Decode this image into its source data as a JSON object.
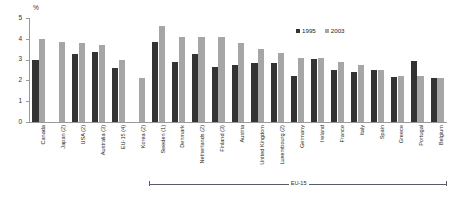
{
  "chart_data": {
    "type": "bar",
    "title": "",
    "subtitle": "",
    "xlabel": "",
    "ylabel": "%",
    "ylim": [
      0,
      5
    ],
    "yticks": [
      "0",
      "1",
      "2",
      "3",
      "4",
      "5"
    ],
    "grid": false,
    "legend_position": "top-right",
    "categories": [
      "Canada",
      "Japan (2)",
      "USA (2)",
      "Australia (3)",
      "EU-15 (4)",
      "Korea (2)",
      "Sweden (1)",
      "Denmark",
      "Netherlands (2)",
      "Finland (3)",
      "Austria",
      "United Kingdom",
      "Luxembourg (2)",
      "Germany",
      "Ireland",
      "France",
      "Italy",
      "Spain",
      "Greece",
      "Portugal",
      "Belgium"
    ],
    "series": [
      {
        "name": "1995",
        "color": "#333333",
        "values": [
          3.0,
          null,
          3.25,
          3.35,
          2.6,
          null,
          3.85,
          2.9,
          3.25,
          2.65,
          2.75,
          2.85,
          2.85,
          2.2,
          3.05,
          2.5,
          2.4,
          2.5,
          2.15,
          2.95,
          2.1
        ]
      },
      {
        "name": "2003",
        "color": "#a6a6a6",
        "values": [
          4.0,
          3.85,
          3.8,
          3.7,
          3.0,
          2.1,
          4.6,
          4.1,
          4.1,
          4.1,
          3.8,
          3.5,
          3.3,
          3.1,
          3.1,
          2.9,
          2.75,
          2.5,
          2.2,
          2.2,
          2.1
        ]
      }
    ],
    "annotations": [
      {
        "name": "eu15-bracket",
        "label": "EU-15",
        "from_category": "Sweden (1)",
        "to_category": "Belgium"
      }
    ]
  },
  "legend": {
    "items": [
      {
        "label": "1995",
        "color": "#333333"
      },
      {
        "label": "2003",
        "color": "#a6a6a6"
      }
    ]
  },
  "axis": {
    "y_unit": "%",
    "y_labels": [
      "0",
      "1",
      "2",
      "3",
      "4",
      "5"
    ]
  },
  "colors": {
    "series_1995": "#333333",
    "series_2003": "#a6a6a6",
    "axis": "#9a9a9a",
    "text": "#2a2a2a",
    "background": "#ffffff"
  }
}
